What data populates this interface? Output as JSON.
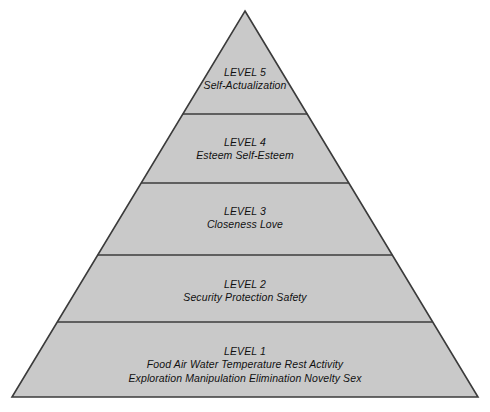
{
  "diagram": {
    "type": "pyramid",
    "shape_name": "hierarchy-of-needs-pyramid",
    "colors": {
      "fill": "#c9c9c9",
      "stroke": "#3b3b3b",
      "divider": "#3b3b3b",
      "text": "#111111",
      "background": "#ffffff"
    },
    "geometry": {
      "apex_x": 245,
      "apex_y": 11,
      "base_left_x": 12,
      "base_right_x": 478,
      "base_y": 397,
      "divider_y": [
        114,
        183,
        255,
        322
      ]
    },
    "levels": [
      {
        "id": "level-5",
        "title": "LEVEL 5",
        "items_line1": "Self-Actualization",
        "items_line2": ""
      },
      {
        "id": "level-4",
        "title": "LEVEL 4",
        "items_line1": "Esteem   Self-Esteem",
        "items_line2": ""
      },
      {
        "id": "level-3",
        "title": "LEVEL 3",
        "items_line1": "Closeness   Love",
        "items_line2": ""
      },
      {
        "id": "level-2",
        "title": "LEVEL 2",
        "items_line1": "Security   Protection   Safety",
        "items_line2": ""
      },
      {
        "id": "level-1",
        "title": "LEVEL 1",
        "items_line1": "Food  Air  Water  Temperature  Rest  Activity",
        "items_line2": "Exploration  Manipulation  Elimination  Novelty  Sex"
      }
    ]
  }
}
